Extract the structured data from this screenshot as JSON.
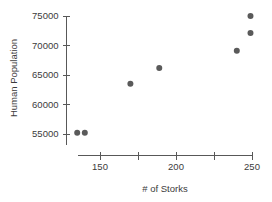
{
  "chart_data": {
    "type": "scatter",
    "title": "",
    "xlabel": "# of Storks",
    "ylabel": "Human Population",
    "xlim": [
      131,
      252
    ],
    "ylim": [
      53800,
      75500
    ],
    "grid": false,
    "legend": null,
    "x_ticks": [
      {
        "value": 150,
        "label": "150"
      },
      {
        "value": 175,
        "label": ""
      },
      {
        "value": 200,
        "label": "200"
      },
      {
        "value": 225,
        "label": ""
      },
      {
        "value": 250,
        "label": "250"
      }
    ],
    "y_ticks": [
      {
        "value": 75000,
        "label": "75000"
      },
      {
        "value": 70000,
        "label": "70000"
      },
      {
        "value": 65000,
        "label": "65000"
      },
      {
        "value": 60000,
        "label": "60000"
      },
      {
        "value": 55000,
        "label": "55000"
      }
    ],
    "x": [
      135,
      140,
      170,
      189,
      240,
      249,
      249
    ],
    "y": [
      55200,
      55200,
      63500,
      66200,
      69100,
      72100,
      75000
    ],
    "points": [
      {
        "x": 135,
        "y": 55200
      },
      {
        "x": 140,
        "y": 55200
      },
      {
        "x": 170,
        "y": 63500
      },
      {
        "x": 189,
        "y": 66200
      },
      {
        "x": 240,
        "y": 69100
      },
      {
        "x": 249,
        "y": 72100
      },
      {
        "x": 249,
        "y": 75000
      }
    ],
    "marker": {
      "shape": "circle",
      "radius_px": 3,
      "color": "#5a5a5a"
    },
    "axis_color": "#585858",
    "text_color": "#3b3b3b",
    "background": "#ffffff"
  }
}
